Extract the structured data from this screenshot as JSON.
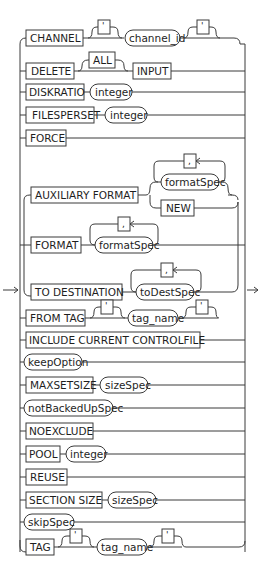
{
  "diagram": {
    "type": "railroad-syntax-diagram",
    "entry_arrow": "→",
    "exit_arrow": "→",
    "options": [
      {
        "keyword": "CHANNEL",
        "args": [
          {
            "type": "optional-quote",
            "text": "'"
          },
          {
            "type": "nonterminal",
            "text": "channel_id"
          },
          {
            "type": "optional-quote",
            "text": "'"
          }
        ]
      },
      {
        "keyword": "DELETE",
        "args": [
          {
            "type": "optional-keyword",
            "text": "ALL"
          },
          {
            "type": "keyword",
            "text": "INPUT"
          }
        ]
      },
      {
        "keyword": "DISKRATIO",
        "args": [
          {
            "type": "nonterminal",
            "text": "integer"
          }
        ]
      },
      {
        "keyword": "FILESPERSET",
        "args": [
          {
            "type": "nonterminal",
            "text": "integer"
          }
        ]
      },
      {
        "keyword": "FORCE",
        "args": []
      },
      {
        "keyword": "AUXILIARY FORMAT",
        "args": [
          {
            "type": "repeat-nonterminal",
            "text": "formatSpec",
            "separator": ","
          },
          {
            "type": "alt-keyword",
            "text": "NEW"
          }
        ]
      },
      {
        "keyword": "FORMAT",
        "args": [
          {
            "type": "repeat-nonterminal",
            "text": "formatSpec",
            "separator": ","
          }
        ]
      },
      {
        "keyword": "TO DESTINATION",
        "args": [
          {
            "type": "repeat-nonterminal",
            "text": "toDestSpec",
            "separator": ","
          }
        ]
      },
      {
        "keyword": "FROM TAG",
        "args": [
          {
            "type": "optional-quote",
            "text": "'"
          },
          {
            "type": "nonterminal",
            "text": "tag_name"
          },
          {
            "type": "optional-quote",
            "text": "'"
          }
        ]
      },
      {
        "keyword": "INCLUDE CURRENT CONTROLFILE",
        "args": []
      },
      {
        "nonterminal": "keepOption",
        "args": []
      },
      {
        "keyword": "MAXSETSIZE",
        "args": [
          {
            "type": "nonterminal",
            "text": "sizeSpec"
          }
        ]
      },
      {
        "nonterminal": "notBackedUpSpec",
        "args": []
      },
      {
        "keyword": "NOEXCLUDE",
        "args": []
      },
      {
        "keyword": "POOL",
        "args": [
          {
            "type": "nonterminal",
            "text": "integer"
          }
        ]
      },
      {
        "keyword": "REUSE",
        "args": []
      },
      {
        "keyword": "SECTION SIZE",
        "args": [
          {
            "type": "nonterminal",
            "text": "sizeSpec"
          }
        ]
      },
      {
        "nonterminal": "skipSpec",
        "args": []
      },
      {
        "keyword": "TAG",
        "args": [
          {
            "type": "optional-quote",
            "text": "'"
          },
          {
            "type": "nonterminal",
            "text": "tag_name"
          },
          {
            "type": "optional-quote",
            "text": "'"
          }
        ]
      }
    ],
    "labels": {
      "channel": "CHANNEL",
      "channel_id": "channel_id",
      "quote": "'",
      "delete": "DELETE",
      "all": "ALL",
      "input": "INPUT",
      "diskratio": "DISKRATIO",
      "integer": "integer",
      "filesperset": "FILESPERSET",
      "force": "FORCE",
      "auxiliary_format": "AUXILIARY FORMAT",
      "formatspec": "formatSpec",
      "comma": ",",
      "new": "NEW",
      "format": "FORMAT",
      "to_destination": "TO DESTINATION",
      "todestspec": "toDestSpec",
      "from_tag": "FROM TAG",
      "tag_name": "tag_name",
      "include_current_controlfile": "INCLUDE CURRENT CONTROLFILE",
      "keepoption": "keepOption",
      "maxsetsize": "MAXSETSIZE",
      "sizespec": "sizeSpec",
      "notbackedupspec": "notBackedUpSpec",
      "noexclude": "NOEXCLUDE",
      "pool": "POOL",
      "reuse": "REUSE",
      "section_size": "SECTION SIZE",
      "skipspec": "skipSpec",
      "tag": "TAG"
    },
    "colors": {
      "line": "#3a3a3a",
      "text": "#1e1e1e",
      "background": "#ffffff"
    }
  }
}
